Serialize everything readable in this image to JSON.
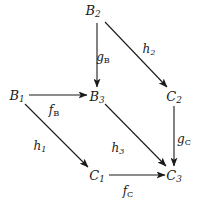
{
  "figure": {
    "kind": "commutative-diagram",
    "width": 201,
    "height": 206,
    "background_color": "#ffffff",
    "ink_color": "#1a1a1a"
  },
  "nodes": [
    {
      "id": "B2",
      "base": "B",
      "sub": "2",
      "x": 93,
      "y": 10
    },
    {
      "id": "B1",
      "base": "B",
      "sub": "1",
      "x": 17,
      "y": 95
    },
    {
      "id": "B3",
      "base": "B",
      "sub": "3",
      "x": 97,
      "y": 96
    },
    {
      "id": "C2",
      "base": "C",
      "sub": "2",
      "x": 174,
      "y": 96
    },
    {
      "id": "C1",
      "base": "C",
      "sub": "1",
      "x": 97,
      "y": 175
    },
    {
      "id": "C3",
      "base": "C",
      "sub": "3",
      "x": 174,
      "y": 175
    }
  ],
  "edges": [
    {
      "id": "gB",
      "from": "B2",
      "to": "B3",
      "base": "g",
      "sub": "B",
      "label_x": 103,
      "label_y": 57
    },
    {
      "id": "h2",
      "from": "B2",
      "to": "C2",
      "base": "h",
      "sub": "2",
      "label_x": 149,
      "label_y": 49
    },
    {
      "id": "fB",
      "from": "B1",
      "to": "B3",
      "base": "f",
      "sub": "B",
      "label_x": 54,
      "label_y": 110
    },
    {
      "id": "h1",
      "from": "B1",
      "to": "C1",
      "base": "h",
      "sub": "1",
      "label_x": 40,
      "label_y": 146
    },
    {
      "id": "h3",
      "from": "B3",
      "to": "C3",
      "base": "h",
      "sub": "3",
      "label_x": 118,
      "label_y": 148
    },
    {
      "id": "gC",
      "from": "C2",
      "to": "C3",
      "base": "g",
      "sub": "C",
      "label_x": 184,
      "label_y": 139
    },
    {
      "id": "fC",
      "from": "C1",
      "to": "C3",
      "base": "f",
      "sub": "C",
      "label_x": 128,
      "label_y": 191
    }
  ],
  "paths": {
    "gB": {
      "x1": 97,
      "y1": 23,
      "x2": 97,
      "y2": 87
    },
    "h2": {
      "x1": 105,
      "y1": 22,
      "x2": 167,
      "y2": 87
    },
    "fB": {
      "x1": 29,
      "y1": 95,
      "x2": 87,
      "y2": 95
    },
    "h1": {
      "x1": 25,
      "y1": 104,
      "x2": 88,
      "y2": 167
    },
    "h3": {
      "x1": 105,
      "y1": 104,
      "x2": 166,
      "y2": 166
    },
    "gC": {
      "x1": 174,
      "y1": 106,
      "x2": 174,
      "y2": 166
    },
    "fC": {
      "x1": 109,
      "y1": 175,
      "x2": 165,
      "y2": 175
    }
  }
}
